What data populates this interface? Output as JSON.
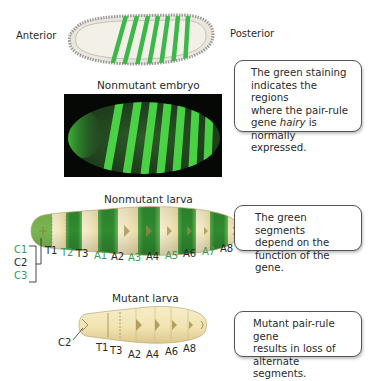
{
  "embryo_diagram": {
    "anterior_label": "Anterior",
    "posterior_label": "Posterior"
  },
  "nonmutant_embryo": {
    "title": "Nonmutant embryo"
  },
  "callout_hairy": {
    "line1": "The green staining",
    "line2": "indicates the regions",
    "line3": "where the pair-rule",
    "line4_prefix": "gene ",
    "line4_italic": "hairy",
    "line4_suffix": " is normally",
    "line5": "expressed."
  },
  "nonmutant_larva": {
    "title": "Nonmutant larva",
    "head_segments": [
      {
        "label": "C1",
        "color": "#3a9a5a"
      },
      {
        "label": "C2",
        "color": "#2a2a2a"
      },
      {
        "label": "C3",
        "color": "#3a9a5a"
      }
    ],
    "segments": [
      {
        "label": "T1",
        "color": "#2a2a2a"
      },
      {
        "label": "T2",
        "color": "#3a9a5a"
      },
      {
        "label": "T3",
        "color": "#2a2a2a"
      },
      {
        "label": "A1",
        "color": "#3a9a5a"
      },
      {
        "label": "A2",
        "color": "#2a2a2a"
      },
      {
        "label": "A3",
        "color": "#3a9a5a"
      },
      {
        "label": "A4",
        "color": "#2a2a2a"
      },
      {
        "label": "A5",
        "color": "#3a9a5a"
      },
      {
        "label": "A6",
        "color": "#2a2a2a"
      },
      {
        "label": "A7",
        "color": "#3a9a5a"
      },
      {
        "label": "A8",
        "color": "#2a2a2a"
      }
    ]
  },
  "callout_segments": {
    "line1": "The green segments",
    "line2": "depend on the",
    "line3": "function of the gene."
  },
  "mutant_larva": {
    "title": "Mutant larva",
    "head_label": "C2",
    "segments": [
      "T1",
      "T3",
      "A2",
      "A4",
      "A6",
      "A8"
    ]
  },
  "callout_mutant": {
    "line1": "Mutant pair-rule gene",
    "line2": "results in loss of",
    "line3": "alternate segments."
  },
  "colors": {
    "stain_green": "#3cb84a",
    "fluor_green": "#4fe04a",
    "larva_cream": "#f2e6b8",
    "larva_green": "#3e9a3c",
    "label_green": "#3a9a5a"
  }
}
